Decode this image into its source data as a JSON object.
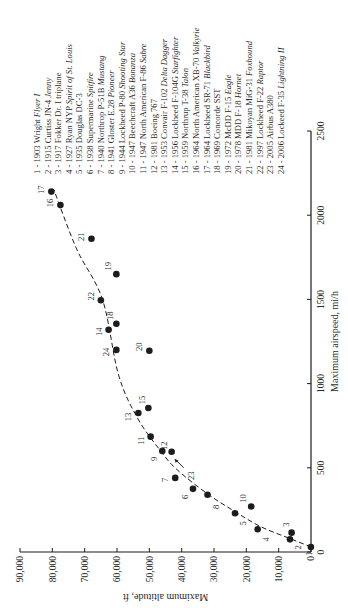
{
  "chart_data": {
    "type": "scatter",
    "title": "",
    "xlabel": "Maximum airspeed, mi/h",
    "ylabel": "Maximum altitude, ft",
    "xlim": [
      0,
      2500
    ],
    "ylim": [
      0,
      90000
    ],
    "x_ticks": [
      0,
      500,
      1000,
      1500,
      2000,
      2500
    ],
    "x_tick_labels": [
      "0",
      "500",
      "1000",
      "1500",
      "2000",
      "2500"
    ],
    "y_ticks": [
      0,
      10000,
      20000,
      30000,
      40000,
      50000,
      60000,
      70000,
      80000,
      90000
    ],
    "y_tick_labels": [
      "0",
      "10,000",
      "20,000",
      "30,000",
      "40,000",
      "50,000",
      "60,000",
      "70,000",
      "80,000",
      "90,000"
    ],
    "grid": false,
    "orientation": "rotated 90° counter-clockwise on page",
    "legend_position": "upper right (of unrotated chart)",
    "trend_line": {
      "style": "dashed",
      "points": [
        [
          30,
          0
        ],
        [
          80,
          6500
        ],
        [
          150,
          15500
        ],
        [
          240,
          23500
        ],
        [
          345,
          32000
        ],
        [
          490,
          41500
        ],
        [
          600,
          46500
        ],
        [
          790,
          53500
        ],
        [
          1050,
          59500
        ],
        [
          1500,
          64500
        ],
        [
          1800,
          72500
        ],
        [
          2150,
          79500
        ]
      ]
    },
    "points": [
      {
        "id": 1,
        "year": 1903,
        "maker": "Wright",
        "model": "Flyer I",
        "speed": 30,
        "altitude": 30
      },
      {
        "id": 2,
        "year": 1915,
        "maker": "Curtiss",
        "model": "JN-4 Jenny",
        "speed": 75,
        "altitude": 6500
      },
      {
        "id": 3,
        "year": 1917,
        "maker": "Fokker",
        "model": "Dr. I triplane",
        "speed": 115,
        "altitude": 6000
      },
      {
        "id": 4,
        "year": 1927,
        "maker": "Ryan",
        "model": "NYP Spirit of St. Louis",
        "speed": 135,
        "altitude": 16500
      },
      {
        "id": 5,
        "year": 1935,
        "maker": "Douglas",
        "model": "DC-3",
        "speed": 230,
        "altitude": 23500
      },
      {
        "id": 6,
        "year": 1938,
        "maker": "Supermarine",
        "model": "Spitfire",
        "speed": 375,
        "altitude": 36500
      },
      {
        "id": 7,
        "year": 1940,
        "maker": "Northrop",
        "model": "P-51B Mustang",
        "speed": 440,
        "altitude": 42000
      },
      {
        "id": 8,
        "year": 1941,
        "maker": "Gloster",
        "model": "E.28 Pioneer",
        "speed": 340,
        "altitude": 32000
      },
      {
        "id": 9,
        "year": 1944,
        "maker": "Lockheed",
        "model": "P-80 Shooting Star",
        "speed": 600,
        "altitude": 46000
      },
      {
        "id": 10,
        "year": 1947,
        "maker": "Beechcraft",
        "model": "A36 Bonanza",
        "speed": 270,
        "altitude": 18500
      },
      {
        "id": 11,
        "year": 1947,
        "maker": "North American",
        "model": "F-86 Sabre",
        "speed": 685,
        "altitude": 49600
      },
      {
        "id": 12,
        "year": 1981,
        "maker": "Boeing",
        "model": "767",
        "speed": 595,
        "altitude": 43100
      },
      {
        "id": 13,
        "year": 1953,
        "maker": "Convair",
        "model": "F-102 Delta Dagger",
        "speed": 825,
        "altitude": 53400
      },
      {
        "id": 14,
        "year": 1956,
        "maker": "Lockheed",
        "model": "F-104G Starfighter",
        "speed": 1320,
        "altitude": 62600
      },
      {
        "id": 15,
        "year": 1959,
        "maker": "Northrop",
        "model": "T-38 Talon",
        "speed": 855,
        "altitude": 50300
      },
      {
        "id": 16,
        "year": 1964,
        "maker": "North American",
        "model": "XB-70 Valkyrie",
        "speed": 2060,
        "altitude": 77500
      },
      {
        "id": 17,
        "year": 1964,
        "maker": "Lockheed",
        "model": "SR-71 Blackbird",
        "speed": 2140,
        "altitude": 80300
      },
      {
        "id": 18,
        "year": 1969,
        "maker": "Concorde",
        "model": "SST",
        "speed": 1355,
        "altitude": 60200
      },
      {
        "id": 19,
        "year": 1972,
        "maker": "McDD",
        "model": "F-15 Eagle",
        "speed": 1650,
        "altitude": 60200
      },
      {
        "id": 20,
        "year": 1978,
        "maker": "MDD",
        "model": "F-18 Hornet",
        "speed": 1195,
        "altitude": 50000
      },
      {
        "id": 21,
        "year": 1981,
        "maker": "Mikoyan",
        "model": "MiG-31 Foxhound",
        "speed": 1860,
        "altitude": 67900
      },
      {
        "id": 22,
        "year": 1997,
        "maker": "Lockheed",
        "model": "F-22 Raptor",
        "speed": 1495,
        "altitude": 65000
      },
      {
        "id": 23,
        "year": 2005,
        "maker": "Airbus",
        "model": "A380",
        "speed": 560,
        "altitude": 42500
      },
      {
        "id": 24,
        "year": 2006,
        "maker": "Lockeed",
        "model": "F-35 Lightning II",
        "speed": 1200,
        "altitude": 60200
      }
    ],
    "legend": [
      {
        "num": "1",
        "plain": "1903 Wright ",
        "italic": "Flyer I"
      },
      {
        "num": "2",
        "plain": "1915 Curtiss JN-4 ",
        "italic": "Jenny"
      },
      {
        "num": "3",
        "plain": "1917 Fokker Dr. I triplane",
        "italic": ""
      },
      {
        "num": "4",
        "plain": "1927 Ryan NYP ",
        "italic": "Spirit of St. Louis"
      },
      {
        "num": "5",
        "plain": "1935 Douglas DC-3",
        "italic": ""
      },
      {
        "num": "6",
        "plain": "1938 Supermarine ",
        "italic": "Spitfire"
      },
      {
        "num": "7",
        "plain": "1940 Northrop P-51B ",
        "italic": "Mustang"
      },
      {
        "num": "8",
        "plain": "1941 Gloster E.28 ",
        "italic": "Pioneer"
      },
      {
        "num": "9",
        "plain": "1944 Lockheed P-80 ",
        "italic": "Shooting Star"
      },
      {
        "num": "10",
        "plain": "1947 Beechcraft A36 ",
        "italic": "Bonanza"
      },
      {
        "num": "11",
        "plain": "1947 North American F-86 ",
        "italic": "Sabre"
      },
      {
        "num": "12",
        "plain": "1981 Boeing 767",
        "italic": ""
      },
      {
        "num": "13",
        "plain": "1953 Convair F-102 ",
        "italic": "Delta Dagger"
      },
      {
        "num": "14",
        "plain": "1956 Lockheed F-104G ",
        "italic": "Starfighter"
      },
      {
        "num": "15",
        "plain": "1959 Northrup T-38 ",
        "italic": "Talon"
      },
      {
        "num": "16",
        "plain": "1964 North American XB-70 ",
        "italic": "Valkyrie"
      },
      {
        "num": "17",
        "plain": "1964 Lockheed SR-71 ",
        "italic": "Blackbird"
      },
      {
        "num": "18",
        "plain": "1969 Concorde SST",
        "italic": ""
      },
      {
        "num": "19",
        "plain": "1972 McDD F-15 ",
        "italic": "Eagle"
      },
      {
        "num": "20",
        "plain": "1978 MDD F-18 ",
        "italic": "Hornet"
      },
      {
        "num": "21",
        "plain": "1981 Mikoyan MiG-31 ",
        "italic": "Foxhound"
      },
      {
        "num": "22",
        "plain": "1997 Lockheed F-22 ",
        "italic": "Raptor"
      },
      {
        "num": "23",
        "plain": "2005 Airbus A380",
        "italic": ""
      },
      {
        "num": "24",
        "plain": "2006 Lockeed F-35 ",
        "italic": "Lightning II"
      }
    ]
  },
  "style": {
    "ink": "#1c1c1c",
    "text": "#2a2a2a",
    "background": "#ffffff"
  }
}
